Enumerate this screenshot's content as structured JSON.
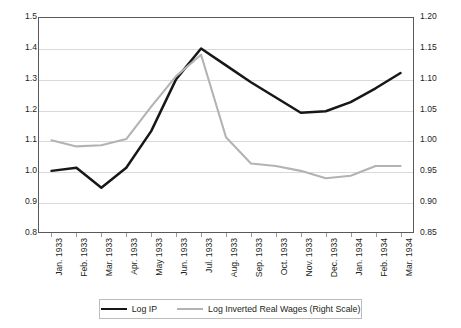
{
  "chart_data": {
    "type": "line",
    "title": "",
    "xlabel": "",
    "ylabel": "",
    "grid": true,
    "legend_position": "bottom",
    "categories": [
      "Jan. 1933",
      "Feb. 1933",
      "Mar. 1933",
      "Apr. 1933",
      "May 1933",
      "Jun. 1933",
      "Jul. 1933",
      "Aug. 1933",
      "Sep. 1933",
      "Oct. 1933",
      "Nov. 1933",
      "Dec. 1933",
      "Jan. 1934",
      "Feb. 1934",
      "Mar. 1934"
    ],
    "left_axis": {
      "label": "",
      "ylim": [
        0.8,
        1.5
      ],
      "tick_step": 0.1,
      "ticks": [
        "1.5",
        "1.4",
        "1.3",
        "1.2",
        "1.1",
        "1.0",
        "0.9",
        "0.8"
      ],
      "tick_values": [
        1.5,
        1.4,
        1.3,
        1.2,
        1.1,
        1.0,
        0.9,
        0.8
      ]
    },
    "right_axis": {
      "label": "",
      "ylim": [
        0.85,
        1.2
      ],
      "tick_step": 0.05,
      "ticks": [
        "1.20",
        "1.15",
        "1.10",
        "1.05",
        "1.00",
        "0.95",
        "0.90",
        "0.85"
      ],
      "tick_values": [
        1.2,
        1.15,
        1.1,
        1.05,
        1.0,
        0.95,
        0.9,
        0.85
      ]
    },
    "series": [
      {
        "name": "Log IP",
        "axis": "left",
        "color": "#171717",
        "values": [
          1.0,
          1.01,
          0.945,
          1.01,
          1.13,
          1.3,
          1.4,
          1.345,
          1.29,
          1.24,
          1.19,
          1.195,
          1.225,
          1.27,
          1.32
        ]
      },
      {
        "name": "Log Inverted Real Wages (Right Scale)",
        "axis": "right",
        "color": "#b3b3b3",
        "values": [
          1.0,
          0.99,
          0.992,
          1.002,
          1.055,
          1.105,
          1.14,
          1.005,
          0.962,
          0.958,
          0.95,
          0.938,
          0.942,
          0.958,
          0.958
        ]
      }
    ]
  },
  "legend": {
    "items": [
      {
        "label": "Log IP",
        "swatch": "black-line-swatch"
      },
      {
        "label": "Log Inverted Real Wages (Right Scale)",
        "swatch": "gray-line-swatch"
      }
    ]
  }
}
